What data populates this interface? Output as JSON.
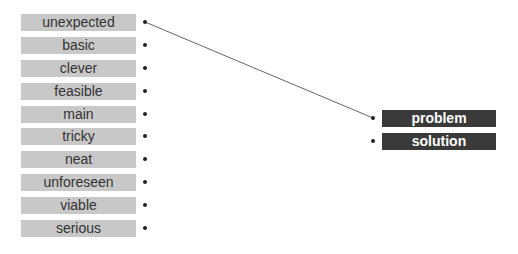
{
  "left_items": [
    {
      "label": "unexpected"
    },
    {
      "label": "basic"
    },
    {
      "label": "clever"
    },
    {
      "label": "feasible"
    },
    {
      "label": "main"
    },
    {
      "label": "tricky"
    },
    {
      "label": "neat"
    },
    {
      "label": "unforeseen"
    },
    {
      "label": "viable"
    },
    {
      "label": "serious"
    }
  ],
  "right_items": [
    {
      "label": "problem"
    },
    {
      "label": "solution"
    }
  ],
  "connections": [
    {
      "from": "unexpected",
      "to": "problem"
    }
  ]
}
